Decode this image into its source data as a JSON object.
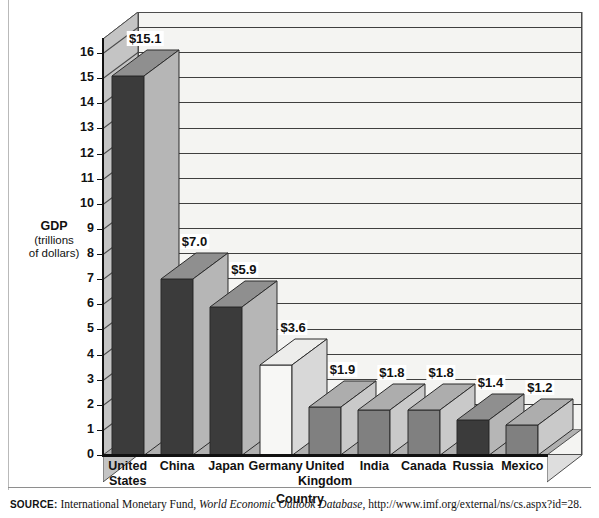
{
  "chart_data": {
    "type": "bar",
    "title": "",
    "xlabel": "Country",
    "ylabel": "GDP (trillions of dollars)",
    "ylabel_line1": "GDP",
    "ylabel_line2": "(trillions",
    "ylabel_line3": "of dollars)",
    "ylim": [
      0,
      16.6
    ],
    "yticks": [
      0,
      1,
      2,
      3,
      4,
      5,
      6,
      7,
      8,
      9,
      10,
      11,
      12,
      13,
      14,
      15,
      16
    ],
    "grid": true,
    "legend": "none",
    "style": "3d-column",
    "categories": [
      "United States",
      "China",
      "Japan",
      "Germany",
      "United Kingdom",
      "India",
      "Canada",
      "Russia",
      "Mexico"
    ],
    "category_labels": [
      "United\nStates",
      "China",
      "Japan",
      "Germany",
      "United\nKingdom",
      "India",
      "Canada",
      "Russia",
      "Mexico"
    ],
    "values": [
      15.1,
      7.0,
      5.9,
      3.6,
      1.9,
      1.8,
      1.8,
      1.4,
      1.2
    ],
    "data_labels": [
      "$15.1",
      "$7.0",
      "$5.9",
      "$3.6",
      "$1.9",
      "$1.8",
      "$1.8",
      "$1.4",
      "$1.2"
    ],
    "bar_shades": [
      "dark",
      "dark",
      "dark",
      "white",
      "mid",
      "mid",
      "mid",
      "dark",
      "mid"
    ]
  },
  "colors": {
    "bar_dark": "#3b3b3b",
    "bar_mid": "#808080",
    "bar_white": "#f7f7f5",
    "bar_side_dark": "#b6b6b6",
    "bar_side_mid": "#c9c9c9",
    "bar_side_white": "#d8d8d8",
    "bar_top_dark": "#8f8f8f",
    "bar_top_mid": "#adadad",
    "bar_top_white": "#ededeb",
    "wall_back": "#f4f4f2",
    "wall_side": "#c4c4c4",
    "wall_top": "#dcdcda",
    "floor": "#b0b0b0",
    "axis": "#111111",
    "grid": "#3f3f3f"
  },
  "source": {
    "label": "SOURCE:",
    "publisher": "International Monetary Fund,",
    "title_italic": "World Economic Outlook Database",
    "url": ", http://www.imf.org/external/ns/cs.aspx?id=28."
  }
}
